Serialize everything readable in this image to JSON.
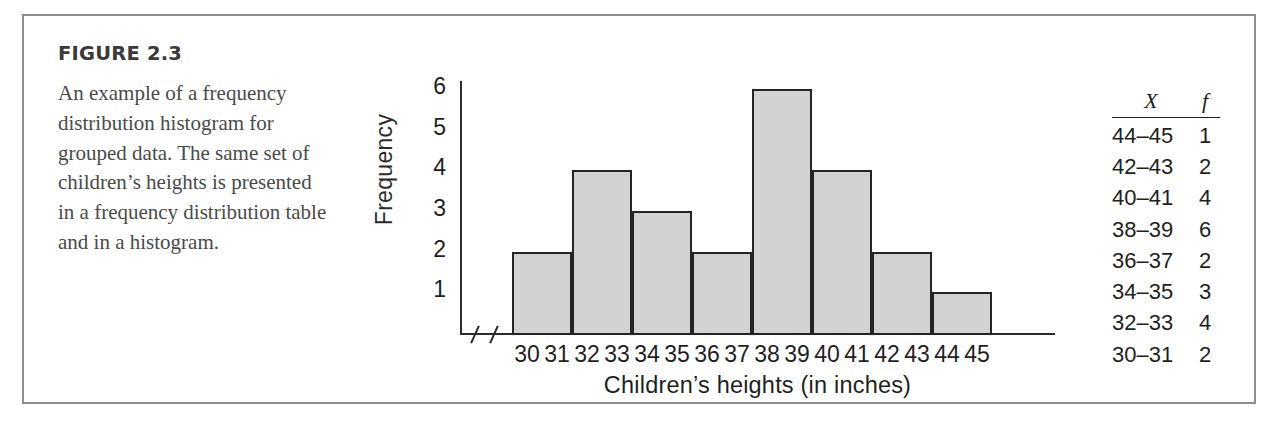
{
  "figure": {
    "label": "FIGURE 2.3",
    "caption": "An example of a frequency distribution histogram for grouped data. The same set of children’s heights is presented in a frequency distribution table and in a histogram."
  },
  "chart_data": {
    "type": "bar",
    "title": "",
    "xlabel": "Children’s heights (in inches)",
    "ylabel": "Frequency",
    "categories": [
      "30–31",
      "32–33",
      "34–35",
      "36–37",
      "38–39",
      "40–41",
      "42–43",
      "44–45"
    ],
    "values": [
      2,
      4,
      3,
      2,
      6,
      4,
      2,
      1
    ],
    "ylim": [
      0,
      6
    ],
    "y_ticks": [
      1,
      2,
      3,
      4,
      5,
      6
    ],
    "x_ticks": [
      30,
      31,
      32,
      33,
      34,
      35,
      36,
      37,
      38,
      39,
      40,
      41,
      42,
      43,
      44,
      45
    ],
    "grid": false,
    "legend": "none",
    "axis_break": true,
    "bar_fill_color": "#d2d2d2",
    "bar_edge_color": "#242424"
  },
  "table": {
    "headers": {
      "x": "X",
      "f": "f"
    },
    "rows": [
      {
        "x": "44–45",
        "f": "1"
      },
      {
        "x": "42–43",
        "f": "2"
      },
      {
        "x": "40–41",
        "f": "4"
      },
      {
        "x": "38–39",
        "f": "6"
      },
      {
        "x": "36–37",
        "f": "2"
      },
      {
        "x": "34–35",
        "f": "3"
      },
      {
        "x": "32–33",
        "f": "4"
      },
      {
        "x": "30–31",
        "f": "2"
      }
    ]
  }
}
